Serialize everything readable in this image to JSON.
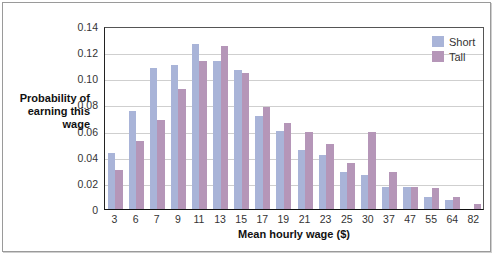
{
  "chart_data": {
    "type": "bar",
    "title": "",
    "xlabel": "Mean hourly wage ($)",
    "ylabel": "Probability of\nearning this\nwage",
    "ylim": [
      0,
      0.14
    ],
    "yticks": [
      "0",
      "0.02",
      "0.04",
      "0.06",
      "0.08",
      "0.10",
      "0.12",
      "0.14"
    ],
    "grid": true,
    "legend_position": "top-right",
    "categories": [
      "3",
      "6",
      "7",
      "9",
      "11",
      "13",
      "15",
      "17",
      "19",
      "21",
      "23",
      "25",
      "30",
      "37",
      "47",
      "55",
      "64",
      "82"
    ],
    "series": [
      {
        "name": "Short",
        "color": "#a9b4d8",
        "values": [
          0.043,
          0.075,
          0.108,
          0.11,
          0.126,
          0.113,
          0.106,
          0.071,
          0.06,
          0.045,
          0.041,
          0.028,
          0.026,
          0.017,
          0.017,
          0.009,
          0.007,
          0.0
        ]
      },
      {
        "name": "Tall",
        "color": "#b596b8",
        "values": [
          0.03,
          0.052,
          0.068,
          0.092,
          0.113,
          0.125,
          0.104,
          0.078,
          0.066,
          0.059,
          0.05,
          0.035,
          0.059,
          0.028,
          0.017,
          0.016,
          0.009,
          0.004
        ]
      }
    ]
  },
  "legend": {
    "short": "Short",
    "tall": "Tall"
  },
  "labels": {
    "x": "Mean hourly wage ($)",
    "y": "Probability of\nearning this\nwage"
  }
}
